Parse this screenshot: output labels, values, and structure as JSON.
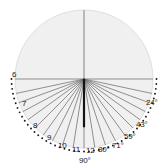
{
  "figure": {
    "name": "polar-fan-diagram",
    "background": "#ffffff",
    "disc": {
      "fill": "#f0f0f0",
      "stroke": "#d8d8d8",
      "center_x": 84,
      "center_y": 79,
      "radius": 69
    },
    "axes": {
      "horizontal_color": "#8c8c8c",
      "vertical_color": "#8c8c8c",
      "hub_color": "#141414"
    },
    "spoke_color": "#6e6e6e",
    "tick_dot_color": "#1a1a1a"
  },
  "chart_data": {
    "type": "scatter",
    "title": "",
    "subtitle": "",
    "xlabel": "",
    "ylabel": "",
    "grid": false,
    "legend": "none",
    "angle_range_deg": [
      0,
      180
    ],
    "left_labels": [
      "6",
      "7",
      "8",
      "9",
      "10",
      "11",
      "12"
    ],
    "right_labels": [
      "24°",
      "43°",
      "59°",
      "71°",
      "80°",
      "90°"
    ],
    "labels": [
      {
        "text": "6",
        "x": 12,
        "y": 71,
        "side": "left",
        "value": 6,
        "unit": "count"
      },
      {
        "text": "7",
        "x": 22,
        "y": 100,
        "side": "left",
        "value": 7,
        "unit": "count"
      },
      {
        "text": "8",
        "x": 33,
        "y": 122,
        "side": "left",
        "value": 8,
        "unit": "count"
      },
      {
        "text": "9",
        "x": 47,
        "y": 134,
        "side": "left",
        "value": 9,
        "unit": "count"
      },
      {
        "text": "10",
        "x": 58,
        "y": 142,
        "side": "left",
        "value": 10,
        "unit": "count"
      },
      {
        "text": "11",
        "x": 72,
        "y": 146,
        "side": "left",
        "value": 11,
        "unit": "count"
      },
      {
        "text": "12",
        "x": 86,
        "y": 147,
        "side": "left",
        "value": 12,
        "unit": "count"
      },
      {
        "text": "80°",
        "x": 98,
        "y": 146,
        "side": "right",
        "value": 80,
        "unit": "deg"
      },
      {
        "text": "71°",
        "x": 112,
        "y": 142,
        "side": "right",
        "value": 71,
        "unit": "deg"
      },
      {
        "text": "59°",
        "x": 124,
        "y": 133,
        "side": "right",
        "value": 59,
        "unit": "deg"
      },
      {
        "text": "43°",
        "x": 136,
        "y": 121,
        "side": "right",
        "value": 43,
        "unit": "deg"
      },
      {
        "text": "24°",
        "x": 146,
        "y": 99,
        "side": "right",
        "value": 24,
        "unit": "deg"
      },
      {
        "text": "90°",
        "x": 79,
        "y": 157,
        "side": "bottom",
        "value": 90,
        "unit": "deg"
      }
    ],
    "spokes_deg_from_down": [
      -78,
      -70,
      -62,
      -54,
      -45,
      -36,
      -27,
      -18,
      -9,
      0,
      9,
      18,
      27,
      36,
      45,
      54,
      62,
      70,
      78
    ],
    "hub_spoke_deg_from_down": 0,
    "tick_dot_count": 46
  }
}
